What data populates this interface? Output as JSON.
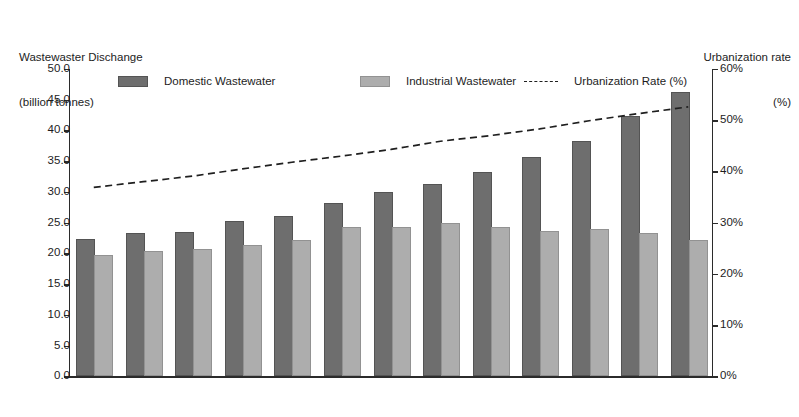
{
  "chart_data": {
    "type": "bar",
    "title": "",
    "categories": [
      "2000",
      "2001",
      "2002",
      "2003",
      "2004",
      "2005",
      "2006",
      "2007",
      "2008",
      "2009",
      "2010",
      "2011",
      "2012"
    ],
    "series": [
      {
        "name": "Domestic Wastewater",
        "type": "bar",
        "axis": "left",
        "color": "#6e6e6e",
        "values": [
          22.0,
          23.0,
          23.1,
          24.9,
          25.8,
          27.9,
          29.7,
          30.9,
          32.9,
          35.4,
          37.9,
          42.1,
          46.0
        ]
      },
      {
        "name": "Industrial Wastewater",
        "type": "bar",
        "axis": "left",
        "color": "#adadad",
        "values": [
          19.4,
          20.0,
          20.4,
          21.0,
          21.9,
          24.0,
          23.9,
          24.6,
          23.9,
          23.4,
          23.7,
          23.0,
          21.8
        ]
      },
      {
        "name": "Urbanization Rate (%)",
        "type": "line",
        "axis": "right",
        "style": "dashed",
        "color": "#1f1f1f",
        "values": [
          36.9,
          38.0,
          39.1,
          40.5,
          41.8,
          43.0,
          44.3,
          45.9,
          47.0,
          48.3,
          49.9,
          51.3,
          52.6
        ]
      }
    ],
    "xlabel": "",
    "ylabel": "Wastewaster Dischange\n(billion tonnes)",
    "y2label": "Urbanization rate\n(%)",
    "ylim": [
      0.0,
      50.0
    ],
    "y2lim": [
      0,
      60
    ],
    "yticks": [
      "0.0",
      "5.0",
      "10.0",
      "15.0",
      "20.0",
      "25.0",
      "30.0",
      "35.0",
      "40.0",
      "45.0",
      "50.0"
    ],
    "ytick_values": [
      0.0,
      5.0,
      10.0,
      15.0,
      20.0,
      25.0,
      30.0,
      35.0,
      40.0,
      45.0,
      50.0
    ],
    "y2ticks": [
      "0%",
      "10%",
      "20%",
      "30%",
      "40%",
      "50%",
      "60%"
    ],
    "y2tick_values": [
      0,
      10,
      20,
      30,
      40,
      50,
      60
    ],
    "grid": false,
    "legend_position": "top"
  },
  "axis_titles": {
    "left_line1": "Wastewaster Dischange",
    "left_line2": "(billion tonnes)",
    "right_line1": "Urbanization rate",
    "right_line2": "(%)"
  },
  "legend": {
    "domestic_label": "Domestic Wastewater",
    "industrial_label": "Industrial Wastewater",
    "rate_label": "Urbanization Rate (%)"
  },
  "colors": {
    "domestic": "#6e6e6e",
    "industrial": "#adadad",
    "line": "#1f1f1f",
    "axis": "#2b2b2b",
    "background": "#ffffff"
  }
}
